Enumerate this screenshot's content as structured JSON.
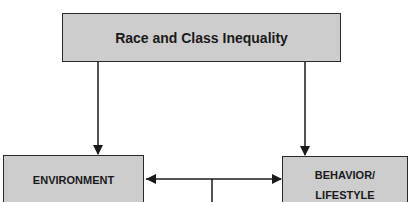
{
  "diagram": {
    "nodes": [
      {
        "id": "top",
        "label": "Race and Class Inequality"
      },
      {
        "id": "env",
        "label": "ENVIRONMENT"
      },
      {
        "id": "beh",
        "label": "BEHAVIOR/\nLIFESTYLE",
        "line1": "BEHAVIOR/",
        "line2": "LIFESTYLE"
      }
    ],
    "edges": [
      {
        "from": "top",
        "to": "env",
        "type": "arrow"
      },
      {
        "from": "top",
        "to": "beh",
        "type": "arrow"
      },
      {
        "from": "env",
        "to": "beh",
        "type": "bidirectional-arrow"
      },
      {
        "from": "env-beh-link",
        "to": "below",
        "type": "line"
      }
    ],
    "colors": {
      "box_fill": "#cdcdcd",
      "stroke": "#2a2a2a"
    }
  }
}
